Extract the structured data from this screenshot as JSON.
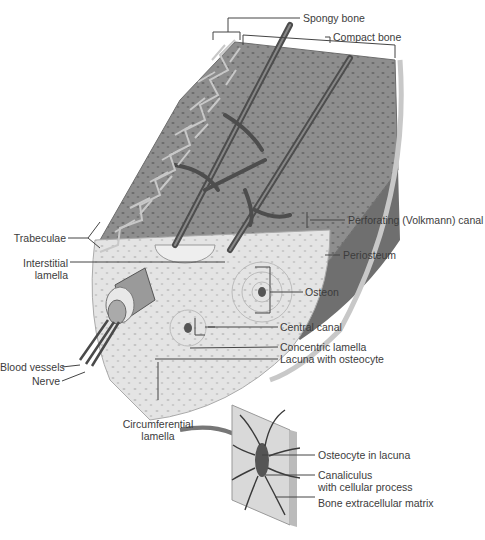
{
  "diagram": {
    "colors": {
      "compact_bone": "#8e8e8e",
      "osteon_region": "#e6e6e6",
      "periosteum": "#6f6f6f",
      "trabeculae": "#d8d8d8",
      "leader_lines": "#444444"
    },
    "labels": {
      "spongy_bone": "Spongy bone",
      "compact_bone": "Compact bone",
      "perforating_canal": "Perforating (Volkmann) canal",
      "trabeculae": "Trabeculae",
      "periosteum": "Periosteum",
      "interstitial_lamella_1": "Interstitial",
      "interstitial_lamella_2": "lamella",
      "osteon": "Osteon",
      "central_canal": "Central canal",
      "concentric_lamella": "Concentric lamella",
      "lacuna_with_osteocyte": "Lacuna with osteocyte",
      "blood_vessels": "Blood vessels",
      "nerve": "Nerve",
      "circumferential_lamella_1": "Circumferential",
      "circumferential_lamella_2": "lamella"
    },
    "inset": {
      "labels": {
        "osteocyte_in_lacuna": "Osteocyte in lacuna",
        "canaliculus_1": "Canaliculus",
        "canaliculus_2": "with cellular process",
        "bone_extracellular_matrix": "Bone extracellular matrix"
      }
    }
  }
}
